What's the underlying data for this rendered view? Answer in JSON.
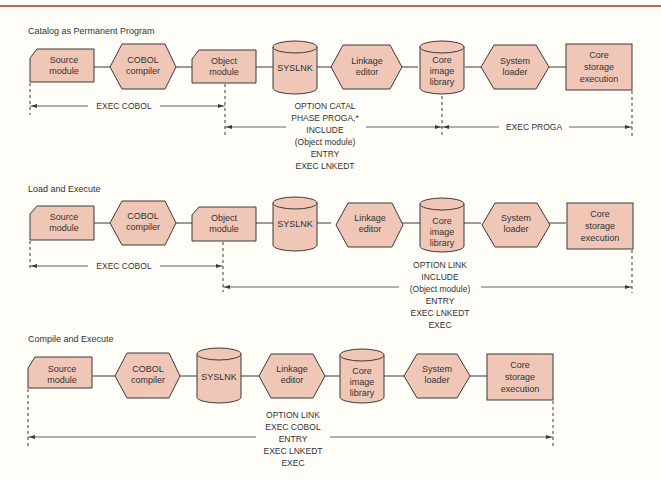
{
  "sections": [
    {
      "title": "Catalog as Permanent Program",
      "nodes": [
        {
          "label": [
            "Source",
            "module"
          ],
          "shape": "card"
        },
        {
          "label": [
            "COBOL",
            "compiler"
          ],
          "shape": "hexagon"
        },
        {
          "label": [
            "Object",
            "module"
          ],
          "shape": "card"
        },
        {
          "label": [
            "SYSLNK"
          ],
          "shape": "cylinder"
        },
        {
          "label": [
            "Linkage",
            "editor"
          ],
          "shape": "hexagon"
        },
        {
          "label": [
            "Core",
            "image",
            "library"
          ],
          "shape": "cylinder"
        },
        {
          "label": [
            "System",
            "loader"
          ],
          "shape": "hexagon"
        },
        {
          "label": [
            "Core",
            "storage",
            "execution"
          ],
          "shape": "rectangle"
        }
      ],
      "spans": [
        {
          "label": [
            "EXEC COBOL"
          ]
        },
        {
          "label": [
            "OPTION CATAL",
            "PHASE PROGA,*",
            "INCLUDE",
            "(Object module)",
            "ENTRY",
            "EXEC LNKEDT"
          ]
        },
        {
          "label": [
            "EXEC PROGA"
          ]
        }
      ]
    },
    {
      "title": "Load and Execute",
      "nodes": [
        {
          "label": [
            "Source",
            "module"
          ],
          "shape": "card"
        },
        {
          "label": [
            "COBOL",
            "compiler"
          ],
          "shape": "hexagon"
        },
        {
          "label": [
            "Object",
            "module"
          ],
          "shape": "card"
        },
        {
          "label": [
            "SYSLNK"
          ],
          "shape": "cylinder"
        },
        {
          "label": [
            "Linkage",
            "editor"
          ],
          "shape": "hexagon"
        },
        {
          "label": [
            "Core",
            "image",
            "library"
          ],
          "shape": "cylinder"
        },
        {
          "label": [
            "System",
            "loader"
          ],
          "shape": "hexagon"
        },
        {
          "label": [
            "Core",
            "storage",
            "execution"
          ],
          "shape": "rectangle"
        }
      ],
      "spans": [
        {
          "label": [
            "EXEC COBOL"
          ]
        },
        {
          "label": [
            "OPTION LINK",
            "INCLUDE",
            "(Object module)",
            "ENTRY",
            "EXEC LNKEDT",
            "EXEC"
          ]
        }
      ]
    },
    {
      "title": "Compile and Execute",
      "nodes": [
        {
          "label": [
            "Source",
            "module"
          ],
          "shape": "card"
        },
        {
          "label": [
            "COBOL",
            "compiler"
          ],
          "shape": "hexagon"
        },
        {
          "label": [
            "SYSLNK"
          ],
          "shape": "cylinder"
        },
        {
          "label": [
            "Linkage",
            "editor"
          ],
          "shape": "hexagon"
        },
        {
          "label": [
            "Core",
            "image",
            "library"
          ],
          "shape": "cylinder"
        },
        {
          "label": [
            "System",
            "loader"
          ],
          "shape": "hexagon"
        },
        {
          "label": [
            "Core",
            "storage",
            "execution"
          ],
          "shape": "rectangle"
        }
      ],
      "spans": [
        {
          "label": [
            "OPTION LINK",
            "EXEC COBOL",
            "ENTRY",
            "EXEC LNKEDT",
            "EXEC"
          ]
        }
      ]
    }
  ],
  "colors": {
    "shape_fill": "#f0c6b6",
    "stroke": "#3a3a3a",
    "rule": "#c0665a",
    "background": "#fffdf8"
  }
}
